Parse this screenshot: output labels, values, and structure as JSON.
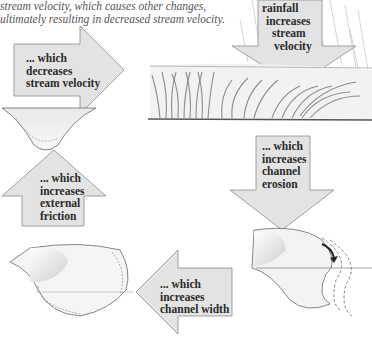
{
  "caption": {
    "line1": "stream velocity, which causes other changes,",
    "line2": "ultimately resulting in decreased stream velocity."
  },
  "arrows": {
    "rainfall": {
      "lines": [
        "rainfall",
        "increases",
        "stream",
        "velocity"
      ],
      "direction": "down-left"
    },
    "decrease_velocity": {
      "lines": [
        "... which",
        "decreases",
        "stream velocity"
      ],
      "direction": "right"
    },
    "external_friction": {
      "lines": [
        "... which",
        "increases",
        "external",
        "friction"
      ],
      "direction": "up"
    },
    "channel_erosion": {
      "lines": [
        "... which",
        "increases",
        "channel",
        "erosion"
      ],
      "direction": "down"
    },
    "channel_width": {
      "lines": [
        "... which",
        "increases",
        "channel width"
      ],
      "direction": "left"
    }
  },
  "colors": {
    "arrow_fill": "#e3e3e3",
    "arrow_stroke": "#8a8a8a",
    "text": "#2a2a2a",
    "caption": "#555555",
    "vegetation": "#8c8c8c"
  }
}
